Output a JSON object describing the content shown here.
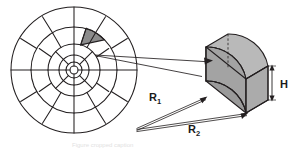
{
  "figure": {
    "background_color": "#ffffff",
    "line_color": "#231f20",
    "fill_gray": "#a3a3a3",
    "fill_gray_dark": "#8f8f8f",
    "fill_gray_light": "#b9b9b9",
    "highlight_color": "#8c8c8c"
  },
  "polar_grid": {
    "name": "polar-grid-diagram",
    "center": {
      "x": 74,
      "y": 70
    },
    "outer_radius": 63,
    "ring_radii": [
      63,
      43,
      26,
      15,
      8,
      4
    ],
    "rings": [
      {
        "index": 1,
        "sectors": 12,
        "outer_r": 63,
        "inner_r": 43
      },
      {
        "index": 2,
        "sectors": 12,
        "outer_r": 43,
        "inner_r": 26
      },
      {
        "index": 3,
        "sectors": 8,
        "outer_r": 26,
        "inner_r": 15
      },
      {
        "index": 4,
        "sectors": 8,
        "outer_r": 15,
        "inner_r": 8
      },
      {
        "index": 5,
        "sectors": 4,
        "outer_r": 8,
        "inner_r": 4
      }
    ],
    "highlighted_cell": {
      "ring": 2,
      "start_angle_deg": -75,
      "end_angle_deg": -45,
      "inner_r": 26,
      "outer_r": 43,
      "fill": "#8c8c8c"
    }
  },
  "leader_lines": {
    "name": "leader-lines",
    "description": "two thin lines connecting the highlighted polar cell to the 3D element"
  },
  "element_3d": {
    "name": "annular-wedge-element",
    "fill": "#a3a3a3",
    "description": "isometric curved wedge (annular sector prism) with dashed hidden edges"
  },
  "labels": {
    "r1": {
      "text": "R",
      "sub": "1",
      "x": 152,
      "y": 97
    },
    "r2": {
      "text": "R",
      "sub": "2",
      "x": 191,
      "y": 129
    },
    "h": {
      "text": "H",
      "x": 279,
      "y": 86
    }
  },
  "caption": {
    "ghost_text": "Figure cropped caption"
  }
}
